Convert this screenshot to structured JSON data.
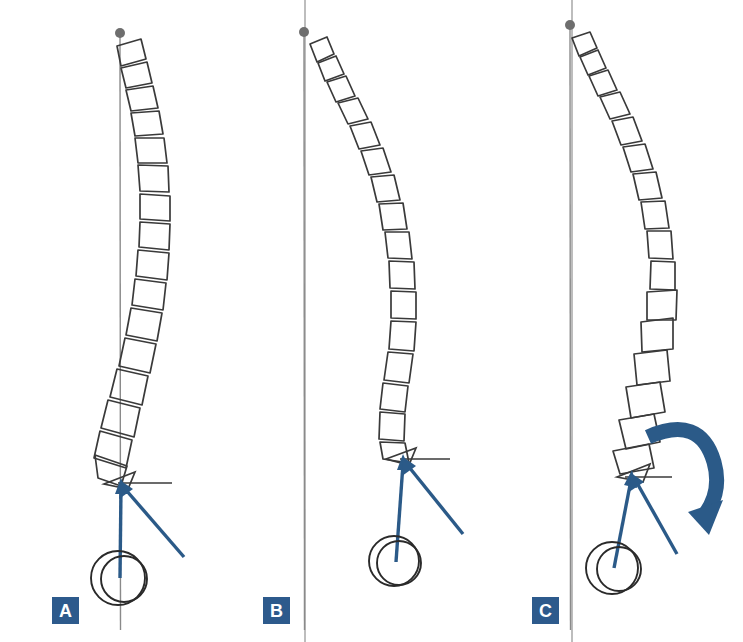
{
  "figure": {
    "panel_count": 3,
    "background_color": "#ffffff"
  },
  "colors": {
    "badge_background": "#2d5a8c",
    "badge_text": "#ffffff",
    "arrow_blue": "#2b5a88",
    "vertebra_outline": "#3a3a3a",
    "plumb_line": "#8a8a8a",
    "plumb_dot": "#6e6e6e",
    "divider": "#9a9a9a",
    "femoral_head": "#2a2a2a",
    "horizontal_tick": "#3a3a3a"
  },
  "panels": [
    {
      "id": "a",
      "label": "A",
      "description": "Balanced sagittal profile with gentle thoracic kyphosis and lumbar lordosis",
      "plumb_line": {
        "x": 120,
        "y_top": 33,
        "y_bottom": 630,
        "dot_radius": 5
      },
      "vertebra_count": 17,
      "femoral_head": {
        "cx": 121,
        "cy": 578,
        "r_outer": 27,
        "r_inner": 23
      },
      "arrow_apex": {
        "x": 120,
        "y": 480
      },
      "arrows": [
        {
          "name": "pelvic-incidence-arrow",
          "from_x": 120,
          "from_y": 578,
          "to_x": 121,
          "to_y": 482
        },
        {
          "name": "sacral-slope-arrow",
          "from_x": 183,
          "from_y": 556,
          "to_x": 123,
          "to_y": 482
        }
      ],
      "horizontal_reference": {
        "x1": 120,
        "x2": 170,
        "y": 482
      },
      "rotation_arrow": false
    },
    {
      "id": "b",
      "label": "B",
      "description": "Forward sagittal imbalance with increased kyphosis and flattened lumbar lordosis",
      "plumb_line": {
        "x": 304,
        "y_top": 32,
        "y_bottom": 630,
        "dot_radius": 5
      },
      "vertebra_count": 17,
      "femoral_head": {
        "cx": 396,
        "cy": 561,
        "r_outer": 25,
        "r_inner": 22
      },
      "arrow_apex": {
        "x": 402,
        "y": 456
      },
      "arrows": [
        {
          "name": "pelvic-incidence-arrow",
          "from_x": 396,
          "from_y": 561,
          "to_x": 404,
          "to_y": 458
        },
        {
          "name": "sacral-slope-arrow",
          "from_x": 462,
          "from_y": 533,
          "to_x": 406,
          "to_y": 458
        }
      ],
      "horizontal_reference": {
        "x1": 402,
        "x2": 450,
        "y": 458
      },
      "rotation_arrow": false
    },
    {
      "id": "c",
      "label": "C",
      "description": "Compensated profile with pelvic retroversion indicated by rotation arrow",
      "plumb_line": {
        "x": 570,
        "y_top": 25,
        "y_bottom": 630,
        "dot_radius": 5
      },
      "vertebra_count": 17,
      "femoral_head": {
        "cx": 615,
        "cy": 568,
        "r_outer": 26,
        "r_inner": 22
      },
      "arrow_apex": {
        "x": 630,
        "y": 472
      },
      "arrows": [
        {
          "name": "pelvic-incidence-arrow",
          "from_x": 614,
          "from_y": 568,
          "to_x": 632,
          "to_y": 474
        },
        {
          "name": "sacral-slope-arrow",
          "from_x": 676,
          "from_y": 553,
          "to_x": 634,
          "to_y": 474
        }
      ],
      "horizontal_reference": {
        "x1": 630,
        "x2": 676,
        "y": 476
      },
      "rotation_arrow": true,
      "rotation_arrow_direction": "clockwise"
    }
  ],
  "dividers": [
    {
      "name": "divider-a-b",
      "x": 305
    },
    {
      "name": "divider-b-c",
      "x": 572
    }
  ]
}
